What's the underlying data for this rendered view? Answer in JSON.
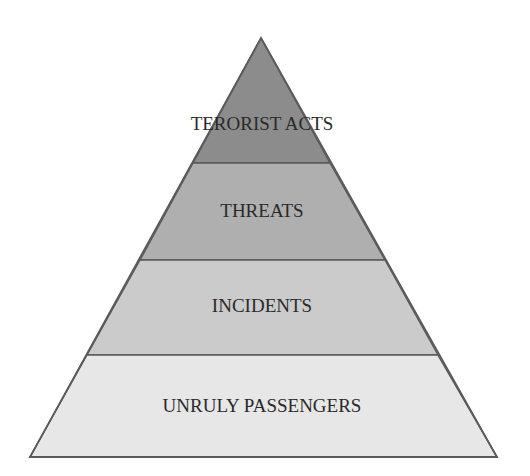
{
  "diagram": {
    "type": "pyramid",
    "outline_color": "#5a5a5a",
    "tiers": [
      {
        "label": "TERORIST ACTS",
        "fill": "#8c8c8c",
        "level": 1
      },
      {
        "label": "THREATS",
        "fill": "#afafaf",
        "level": 2
      },
      {
        "label": "INCIDENTS",
        "fill": "#cbcbcb",
        "level": 3
      },
      {
        "label": "UNRULY PASSENGERS",
        "fill": "#e7e7e7",
        "level": 4
      }
    ]
  }
}
